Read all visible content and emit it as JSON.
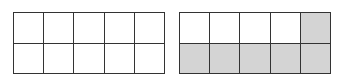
{
  "diagram": {
    "type": "fraction-grids",
    "colors": {
      "border": "#333333",
      "empty": "#ffffff",
      "shaded": "#d4d4d4"
    },
    "grids": [
      {
        "name": "left",
        "rows": 2,
        "cols": 5,
        "shaded": [
          [
            0,
            0,
            0,
            0,
            0
          ],
          [
            0,
            0,
            0,
            0,
            0
          ]
        ],
        "shaded_count": 0,
        "total": 10
      },
      {
        "name": "right",
        "rows": 2,
        "cols": 5,
        "shaded": [
          [
            0,
            0,
            0,
            0,
            1
          ],
          [
            1,
            1,
            1,
            1,
            1
          ]
        ],
        "shaded_count": 6,
        "total": 10
      }
    ]
  }
}
